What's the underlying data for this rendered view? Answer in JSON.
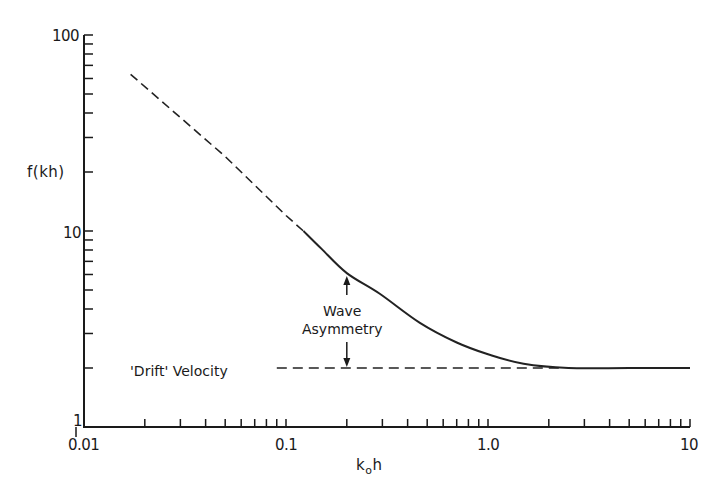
{
  "chart_data": {
    "type": "line",
    "title": "",
    "xlabel": "k0h",
    "xlabel_parts": {
      "main": "k",
      "sub": "o",
      "rest": "h"
    },
    "ylabel": "f(kh)",
    "xscale": "log",
    "yscale": "log",
    "xlim": [
      0.01,
      10
    ],
    "ylim": [
      1,
      100
    ],
    "grid": false,
    "x_tick_labels": [
      "0.01",
      "0.1",
      "1.0",
      "10"
    ],
    "x_tick_values": [
      0.01,
      0.1,
      1.0,
      10
    ],
    "y_tick_labels": [
      "1",
      "10",
      "100"
    ],
    "y_tick_values": [
      1,
      10,
      100
    ],
    "series": [
      {
        "name": "f(kh) extrapolated",
        "style": "dashed",
        "x": [
          0.017,
          0.05,
          0.1,
          0.122
        ],
        "y": [
          63,
          24,
          12,
          10
        ]
      },
      {
        "name": "f(kh)",
        "style": "solid",
        "x": [
          0.122,
          0.15,
          0.2,
          0.29,
          0.46,
          0.7,
          1.0,
          1.5,
          2.5,
          5.0,
          10.0
        ],
        "y": [
          10,
          8.1,
          6.1,
          4.8,
          3.4,
          2.7,
          2.35,
          2.1,
          2.0,
          2.0,
          2.0
        ]
      },
      {
        "name": "'Drift' Velocity",
        "style": "dashed",
        "x": [
          0.09,
          2.3
        ],
        "y": [
          2,
          2
        ]
      }
    ],
    "annotations": [
      {
        "text": "Wave Asymmetry",
        "lines": [
          "Wave",
          "Asymmetry"
        ],
        "type": "double-arrow",
        "x": 0.2,
        "y_from": 2,
        "y_to": 6.1
      },
      {
        "text": "'Drift' Velocity",
        "x": 0.04,
        "y": 2
      }
    ]
  }
}
